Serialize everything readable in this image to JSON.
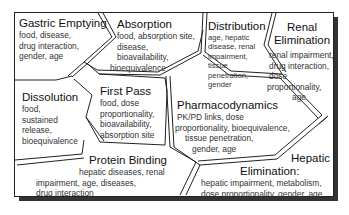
{
  "diagram": {
    "regions": [
      {
        "id": "gastric_emptying",
        "title": "Gastric Emptying",
        "lines": [
          "food, disease,",
          "drug interaction,",
          "gender, age"
        ]
      },
      {
        "id": "absorption",
        "title": "Absorption",
        "lines": [
          "food, absorption site,",
          "disease,",
          "bioavailability,",
          "bioequivalence"
        ]
      },
      {
        "id": "distribution",
        "title": "Distribution",
        "lines": [
          "age, hepatic",
          "disease, renal",
          "impairment,",
          "tissue",
          "penetration,",
          "gender"
        ]
      },
      {
        "id": "renal_elimination",
        "title_lines": [
          "Renal",
          "Elimination"
        ],
        "lines": [
          "renal impairment,",
          "drug interaction,",
          "dose",
          "proportionality,",
          "age"
        ]
      },
      {
        "id": "dissolution",
        "title": "Dissolution",
        "lines": [
          "food,",
          "sustained",
          "release,",
          "bioequivalence"
        ]
      },
      {
        "id": "first_pass",
        "title": "First Pass",
        "lines": [
          "food, dose",
          "proportionality,",
          "bioavailability,",
          "absorption site"
        ]
      },
      {
        "id": "pharmacodynamics",
        "title": "Pharmacodynamics",
        "lines": [
          "PK/PD links, dose",
          "proportionality, bioequivalence,",
          "tissue penetration,",
          "gender, age"
        ]
      },
      {
        "id": "protein_binding",
        "title": "Protein Binding",
        "lines": [
          "hepatic diseases, renal",
          "impairment, age, diseases,",
          "drug interaction"
        ]
      },
      {
        "id": "hepatic_elimination",
        "title_lines": [
          "Hepatic",
          "Elimination:"
        ],
        "lines": [
          "hepatic impairment, metabolism,",
          "dose proportionality, gender, age"
        ]
      }
    ]
  }
}
